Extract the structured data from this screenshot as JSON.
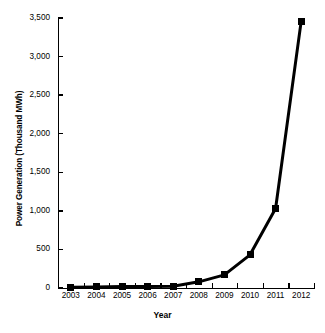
{
  "chart_data": {
    "type": "line",
    "title": "",
    "xlabel": "Year",
    "ylabel": "Power Generation (Thousand MWh)",
    "categories": [
      "2003",
      "2004",
      "2005",
      "2006",
      "2007",
      "2008",
      "2009",
      "2010",
      "2011",
      "2012"
    ],
    "x": [
      2003,
      2004,
      2005,
      2006,
      2007,
      2008,
      2009,
      2010,
      2011,
      2012
    ],
    "values": [
      10,
      14,
      18,
      20,
      24,
      80,
      170,
      430,
      1030,
      3460
    ],
    "series": [
      {
        "name": "Power Generation",
        "values": [
          10,
          14,
          18,
          20,
          24,
          80,
          170,
          430,
          1030,
          3460
        ]
      }
    ],
    "ylim": [
      0,
      3500
    ],
    "ytick_labels": [
      "0",
      "500",
      "1,000",
      "1,500",
      "2,000",
      "2,500",
      "3,000",
      "3,500"
    ],
    "ytick_values": [
      0,
      500,
      1000,
      1500,
      2000,
      2500,
      3000,
      3500
    ],
    "xtick_labels": [
      "2003",
      "2004",
      "2005",
      "2006",
      "2007",
      "2008",
      "2009",
      "2010",
      "2011",
      "2012"
    ],
    "grid": false,
    "legend": "none",
    "marker": "square",
    "line_color": "#000000",
    "marker_color": "#000000",
    "background_color": "#ffffff"
  }
}
